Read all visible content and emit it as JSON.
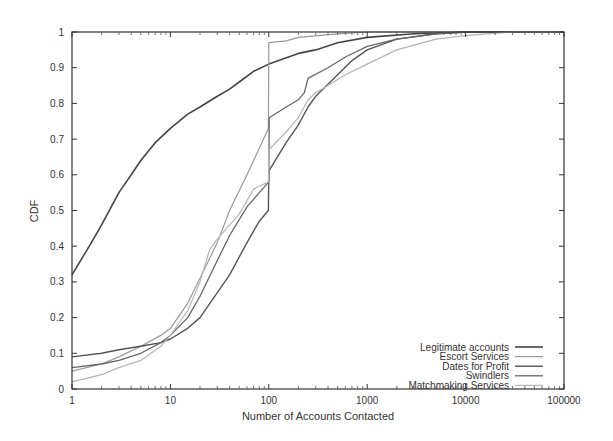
{
  "chart_data": {
    "type": "line",
    "title": "",
    "xlabel": "Number of Accounts Contacted",
    "ylabel": "CDF",
    "xscale": "log",
    "xlim": [
      1,
      100000
    ],
    "ylim": [
      0,
      1
    ],
    "grid": false,
    "legend_position": "lower right",
    "x_ticks": [
      "1",
      "10",
      "100",
      "1000",
      "10000",
      "100000"
    ],
    "y_ticks": [
      "0",
      "0.1",
      "0.2",
      "0.3",
      "0.4",
      "0.5",
      "0.6",
      "0.7",
      "0.8",
      "0.9",
      "1"
    ],
    "series": [
      {
        "name": "Legitimate accounts",
        "color": "#444444",
        "width": 1.6,
        "dash": "",
        "points": [
          [
            1,
            0.32
          ],
          [
            1.5,
            0.4
          ],
          [
            2,
            0.46
          ],
          [
            3,
            0.55
          ],
          [
            4,
            0.6
          ],
          [
            5,
            0.64
          ],
          [
            7,
            0.69
          ],
          [
            10,
            0.73
          ],
          [
            15,
            0.77
          ],
          [
            20,
            0.79
          ],
          [
            30,
            0.82
          ],
          [
            40,
            0.84
          ],
          [
            50,
            0.86
          ],
          [
            70,
            0.89
          ],
          [
            100,
            0.91
          ],
          [
            200,
            0.94
          ],
          [
            300,
            0.95
          ],
          [
            500,
            0.97
          ],
          [
            1000,
            0.985
          ],
          [
            3000,
            0.995
          ],
          [
            10000,
            1.0
          ],
          [
            100000,
            1.0
          ]
        ]
      },
      {
        "name": "Escort Services",
        "color": "#999999",
        "width": 1.2,
        "dash": "",
        "points": [
          [
            1,
            0.05
          ],
          [
            2,
            0.07
          ],
          [
            3,
            0.09
          ],
          [
            5,
            0.12
          ],
          [
            8,
            0.15
          ],
          [
            10,
            0.17
          ],
          [
            15,
            0.24
          ],
          [
            20,
            0.31
          ],
          [
            30,
            0.41
          ],
          [
            40,
            0.5
          ],
          [
            60,
            0.6
          ],
          [
            99,
            0.73
          ],
          [
            100,
            0.97
          ],
          [
            150,
            0.975
          ],
          [
            200,
            0.985
          ],
          [
            500,
            0.995
          ],
          [
            1000,
            1.0
          ],
          [
            100000,
            1.0
          ]
        ]
      },
      {
        "name": "Dates for Profit",
        "color": "#555555",
        "width": 1.4,
        "dash": "",
        "points": [
          [
            1,
            0.09
          ],
          [
            2,
            0.1
          ],
          [
            3,
            0.11
          ],
          [
            5,
            0.12
          ],
          [
            8,
            0.13
          ],
          [
            10,
            0.14
          ],
          [
            15,
            0.17
          ],
          [
            20,
            0.2
          ],
          [
            30,
            0.27
          ],
          [
            40,
            0.32
          ],
          [
            60,
            0.41
          ],
          [
            80,
            0.47
          ],
          [
            99,
            0.5
          ],
          [
            100,
            0.61
          ],
          [
            150,
            0.69
          ],
          [
            200,
            0.74
          ],
          [
            250,
            0.79
          ],
          [
            300,
            0.82
          ],
          [
            500,
            0.88
          ],
          [
            700,
            0.92
          ],
          [
            1000,
            0.95
          ],
          [
            2000,
            0.98
          ],
          [
            5000,
            0.995
          ],
          [
            10000,
            1.0
          ],
          [
            100000,
            1.0
          ]
        ]
      },
      {
        "name": "Swindlers",
        "color": "#666666",
        "width": 1.3,
        "dash": "",
        "points": [
          [
            1,
            0.06
          ],
          [
            2,
            0.07
          ],
          [
            3,
            0.08
          ],
          [
            5,
            0.1
          ],
          [
            8,
            0.13
          ],
          [
            10,
            0.15
          ],
          [
            15,
            0.2
          ],
          [
            20,
            0.26
          ],
          [
            30,
            0.36
          ],
          [
            40,
            0.43
          ],
          [
            60,
            0.51
          ],
          [
            80,
            0.55
          ],
          [
            100,
            0.58
          ],
          [
            101,
            0.76
          ],
          [
            150,
            0.79
          ],
          [
            200,
            0.81
          ],
          [
            230,
            0.83
          ],
          [
            250,
            0.87
          ],
          [
            400,
            0.9
          ],
          [
            600,
            0.93
          ],
          [
            1000,
            0.96
          ],
          [
            2000,
            0.98
          ],
          [
            5000,
            0.995
          ],
          [
            10000,
            1.0
          ],
          [
            100000,
            1.0
          ]
        ]
      },
      {
        "name": "Matchmaking Services",
        "color": "#b5b5b5",
        "width": 1.2,
        "dash": "",
        "points": [
          [
            1,
            0.02
          ],
          [
            2,
            0.04
          ],
          [
            3,
            0.06
          ],
          [
            5,
            0.08
          ],
          [
            8,
            0.12
          ],
          [
            10,
            0.15
          ],
          [
            15,
            0.22
          ],
          [
            20,
            0.3
          ],
          [
            25,
            0.39
          ],
          [
            30,
            0.42
          ],
          [
            40,
            0.46
          ],
          [
            50,
            0.49
          ],
          [
            70,
            0.56
          ],
          [
            99,
            0.58
          ],
          [
            100,
            0.67
          ],
          [
            150,
            0.72
          ],
          [
            200,
            0.76
          ],
          [
            250,
            0.81
          ],
          [
            300,
            0.83
          ],
          [
            400,
            0.85
          ],
          [
            600,
            0.88
          ],
          [
            1000,
            0.91
          ],
          [
            2000,
            0.95
          ],
          [
            5000,
            0.98
          ],
          [
            10000,
            0.99
          ],
          [
            30000,
            1.0
          ],
          [
            100000,
            1.0
          ]
        ]
      }
    ]
  },
  "legend": {
    "items": [
      {
        "label": "Legitimate accounts"
      },
      {
        "label": "Escort Services"
      },
      {
        "label": "Dates for Profit"
      },
      {
        "label": "Swindlers"
      },
      {
        "label": "Matchmaking Services"
      }
    ]
  }
}
